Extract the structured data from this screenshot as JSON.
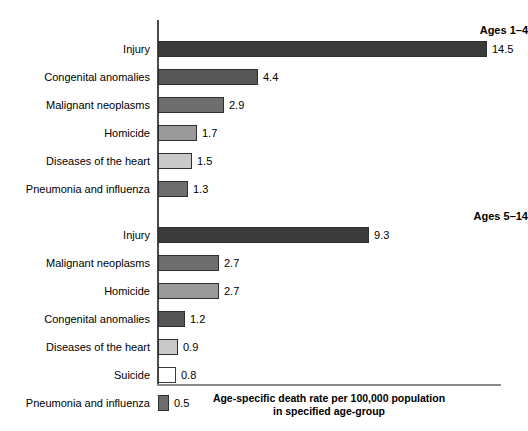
{
  "chart_data": {
    "type": "bar",
    "orientation": "horizontal",
    "title": "",
    "xlabel": "Age-specific death rate per 100,000 population in specified age-group",
    "ylabel": "",
    "xlim": [
      0,
      15.1
    ],
    "grid": false,
    "legend": "none",
    "value_labels": true,
    "groups": [
      {
        "name": "Ages 1–4",
        "categories": [
          "Injury",
          "Congenital anomalies",
          "Malignant neoplasms",
          "Homicide",
          "Diseases of the heart",
          "Pneumonia and influenza"
        ],
        "values": [
          14.5,
          4.4,
          2.9,
          1.7,
          1.5,
          1.3
        ],
        "value_labels_text": [
          "14.5",
          "4.4",
          "2.9",
          "1.7",
          "1.5",
          "1.3"
        ],
        "colors": [
          "#3b3b3b",
          "#565656",
          "#6e6e6e",
          "#9a9a9a",
          "#c9c9c9",
          "#6e6e6e"
        ]
      },
      {
        "name": "Ages 5–14",
        "categories": [
          "Injury",
          "Malignant neoplasms",
          "Homicide",
          "Congenital anomalies",
          "Diseases of the heart",
          "Suicide",
          "Pneumonia and influenza"
        ],
        "values": [
          9.3,
          2.7,
          2.7,
          1.2,
          0.9,
          0.8,
          0.5
        ],
        "value_labels_text": [
          "9.3",
          "2.7",
          "2.7",
          "1.2",
          "0.9",
          "0.8",
          "0.5"
        ],
        "colors": [
          "#3b3b3b",
          "#6e6e6e",
          "#9a9a9a",
          "#555555",
          "#c9c9c9",
          "#ffffff",
          "#6e6e6e"
        ]
      }
    ],
    "caption_line1": "Age-specific death rate per 100,000 population",
    "caption_line2": "in specified age-group",
    "axis_color": "#4a4a4a",
    "background": "#ffffff",
    "px_per_unit": 22.7,
    "axis_origin_x": 158
  }
}
